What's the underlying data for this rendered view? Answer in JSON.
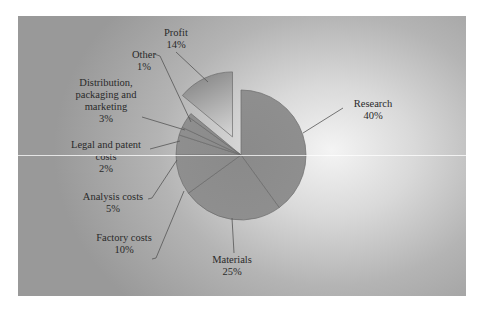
{
  "chart_data": {
    "type": "pie",
    "title": "",
    "start_angle_deg": 0,
    "direction": "clockwise",
    "categories": [
      "Research",
      "Materials",
      "Factory costs",
      "Analysis costs",
      "Legal and patent costs",
      "Distribution, packaging and marketing",
      "Other",
      "Profit"
    ],
    "values": [
      40,
      25,
      10,
      5,
      2,
      3,
      1,
      14
    ],
    "value_labels": [
      "40%",
      "25%",
      "10%",
      "5%",
      "2%",
      "3%",
      "1%",
      "14%"
    ],
    "exploded": [
      "Profit"
    ],
    "legend": "none",
    "grid": false
  },
  "labels": {
    "research": {
      "name": "Research",
      "pct": "40%"
    },
    "materials": {
      "name": "Materials",
      "pct": "25%"
    },
    "factory": {
      "name": "Factory costs",
      "pct": "10%"
    },
    "analysis": {
      "name": "Analysis costs",
      "pct": "5%"
    },
    "legal": {
      "line1": "Legal and patent",
      "line2": "costs",
      "pct": "2%"
    },
    "distribution": {
      "line1": "Distribution,",
      "line2": "packaging and",
      "line3": "marketing",
      "pct": "3%"
    },
    "other": {
      "name": "Other",
      "pct": "1%"
    },
    "profit": {
      "name": "Profit",
      "pct": "14%"
    }
  },
  "colors": {
    "slice_fill": "#8c8c8c",
    "slice_stroke": "#6a6a6a",
    "profit_light": "#c8c8c8",
    "profit_dark": "#8e8e8e",
    "text": "#2a2a2a"
  }
}
